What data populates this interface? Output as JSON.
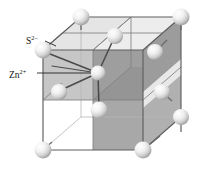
{
  "figure": {
    "labels": {
      "anion": {
        "symbol": "S",
        "charge": "2–",
        "full": "S2–",
        "name": "sulfide-ion-label"
      },
      "cation": {
        "symbol": "Zn",
        "charge": "2+",
        "full": "Zn2+",
        "name": "zinc-ion-label"
      }
    },
    "colors": {
      "background": "#ffffff",
      "sphere_light": "#ffffff",
      "sphere_mid": "#d8d8d8",
      "sphere_shadow": "#9a9a9a",
      "face_light": "#e4e4e4",
      "face_mid": "#c9c9c9",
      "face_dark": "#9e9e9e",
      "face_darker": "#8c8c8c",
      "edge": "#6d6d6d",
      "edge_faint": "#b4b4b4",
      "bond": "#4a4a4a",
      "leader": "#222222",
      "text": "#111111"
    },
    "geometry": {
      "projection": "oblique",
      "front_face": {
        "left": 43,
        "top": 50,
        "right": 143,
        "bottom": 150
      },
      "depth_dx": 38,
      "depth_dy": -33,
      "sphere_radius_corner": 8.5,
      "sphere_radius_interior": 8.0
    },
    "atoms": {
      "anion_positions": [
        {
          "id": "corner-back-top-left",
          "x": 81,
          "y": 17
        },
        {
          "id": "corner-back-top-right",
          "x": 181,
          "y": 17
        },
        {
          "id": "corner-front-top-left",
          "x": 43,
          "y": 50
        },
        {
          "id": "face-back-top-center",
          "x": 115,
          "y": 36
        },
        {
          "id": "face-right-upper",
          "x": 155,
          "y": 52
        },
        {
          "id": "face-front-mid-left",
          "x": 59,
          "y": 92
        },
        {
          "id": "face-front-center",
          "x": 99,
          "y": 110
        },
        {
          "id": "face-right-lower",
          "x": 162,
          "y": 92
        },
        {
          "id": "corner-front-bottom-left",
          "x": 43,
          "y": 150
        },
        {
          "id": "corner-front-bottom-right",
          "x": 143,
          "y": 150
        },
        {
          "id": "corner-back-bottom-right",
          "x": 181,
          "y": 117
        }
      ],
      "cation_positions": [
        {
          "id": "zinc-tetrahedral-center",
          "x": 98,
          "y": 73
        }
      ],
      "bonds": [
        {
          "from": "zinc-tetrahedral-center",
          "to": "corner-front-top-left"
        },
        {
          "from": "zinc-tetrahedral-center",
          "to": "face-back-top-center"
        },
        {
          "from": "zinc-tetrahedral-center",
          "to": "face-front-mid-left"
        },
        {
          "from": "zinc-tetrahedral-center",
          "to": "face-front-center"
        }
      ],
      "leader_lines": [
        {
          "name": "sulfide-leader",
          "x1": 45,
          "y1": 41,
          "x2": 57,
          "y2": 47
        },
        {
          "name": "zinc-leader",
          "x1": 38,
          "y1": 73,
          "x2": 92,
          "y2": 73
        }
      ]
    }
  }
}
